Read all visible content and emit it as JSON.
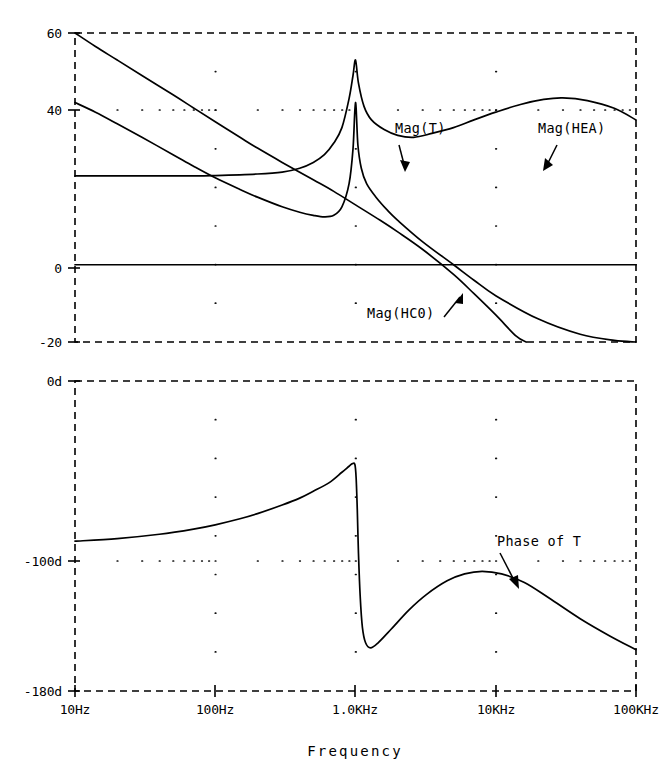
{
  "chart_data": {
    "type": "line",
    "title": "",
    "xlabel": "Frequency",
    "xscale": "log",
    "xlim": [
      10,
      100000
    ],
    "xticks": [
      10,
      100,
      1000,
      10000,
      100000
    ],
    "xtick_labels": [
      "10Hz",
      "100Hz",
      "1.0KHz",
      "10KHz",
      "100KHz"
    ],
    "grid": true,
    "legend": "annotations",
    "panels": [
      {
        "name": "magnitude",
        "ylabel": "",
        "ylim": [
          -20,
          60
        ],
        "yticks": [
          -20,
          0,
          40,
          60
        ],
        "ytick_labels": [
          "-20",
          "0",
          "40",
          "60"
        ],
        "units": "dB",
        "series": [
          {
            "name": "Mag(HC0)",
            "label": "Mag(HC0)",
            "annotation": "Mag(HC0)",
            "description": "Falls monotonically from 60 dB at 10 Hz, crossing 0 dB near 3 kHz and reaching -20 dB near 20 kHz",
            "points": [
              [
                10,
                60.0
              ],
              [
                14,
                56.5
              ],
              [
                20,
                53.0
              ],
              [
                30,
                49.0
              ],
              [
                50,
                44.0
              ],
              [
                70,
                40.6
              ],
              [
                100,
                37.0
              ],
              [
                150,
                33.0
              ],
              [
                200,
                30.2
              ],
              [
                300,
                26.5
              ],
              [
                500,
                22.0
              ],
              [
                700,
                19.0
              ],
              [
                1000,
                15.5
              ],
              [
                1500,
                11.5
              ],
              [
                2000,
                8.5
              ],
              [
                3000,
                4.0
              ],
              [
                5000,
                -2.5
              ],
              [
                7000,
                -7.5
              ],
              [
                10000,
                -13.0
              ],
              [
                14000,
                -18.5
              ],
              [
                16500,
                -20.0
              ]
            ]
          },
          {
            "name": "Mag(T)",
            "label": "Mag(T)",
            "annotation": "Mag(T)",
            "description": "Starts at 42 dB at 10 Hz, decays to a minimum of ~12 dB near 600 Hz, resonant peak of 42 dB at 1 kHz, then falls steeply past 0 dB to -20 dB at 100 kHz",
            "points": [
              [
                10,
                42.0
              ],
              [
                14,
                39.5
              ],
              [
                20,
                36.5
              ],
              [
                30,
                33.0
              ],
              [
                50,
                28.5
              ],
              [
                70,
                25.5
              ],
              [
                100,
                22.5
              ],
              [
                150,
                19.5
              ],
              [
                200,
                17.5
              ],
              [
                300,
                15.0
              ],
              [
                400,
                13.6
              ],
              [
                500,
                12.8
              ],
              [
                600,
                12.4
              ],
              [
                700,
                12.8
              ],
              [
                800,
                15.0
              ],
              [
                900,
                21.0
              ],
              [
                960,
                30.0
              ],
              [
                1000,
                42.0
              ],
              [
                1040,
                31.0
              ],
              [
                1100,
                25.0
              ],
              [
                1200,
                21.0
              ],
              [
                1400,
                17.5
              ],
              [
                1700,
                14.0
              ],
              [
                2000,
                11.5
              ],
              [
                3000,
                6.0
              ],
              [
                5000,
                0.0
              ],
              [
                7000,
                -4.0
              ],
              [
                10000,
                -8.0
              ],
              [
                20000,
                -14.0
              ],
              [
                40000,
                -18.0
              ],
              [
                70000,
                -19.6
              ],
              [
                100000,
                -20.0
              ]
            ]
          },
          {
            "name": "Mag(HEA)",
            "label": "Mag(HEA)",
            "annotation": "Mag(HEA)",
            "description": "Flat at 23 dB from 10 Hz, rises to a resonance peak of 53 dB at 1 kHz, falls to a local minimum of ~33 dB near 2.5 kHz, broad hump peaking at 25 dB near 30 kHz, ending near 18 dB at 100 kHz",
            "points": [
              [
                10,
                23.0
              ],
              [
                30,
                23.0
              ],
              [
                70,
                23.0
              ],
              [
                100,
                23.1
              ],
              [
                200,
                23.5
              ],
              [
                300,
                24.0
              ],
              [
                400,
                25.0
              ],
              [
                500,
                26.5
              ],
              [
                600,
                28.5
              ],
              [
                700,
                31.5
              ],
              [
                800,
                35.5
              ],
              [
                900,
                43.0
              ],
              [
                960,
                49.0
              ],
              [
                1000,
                53.0
              ],
              [
                1050,
                47.0
              ],
              [
                1150,
                41.0
              ],
              [
                1300,
                37.5
              ],
              [
                1600,
                35.0
              ],
              [
                2000,
                33.5
              ],
              [
                2600,
                33.0
              ],
              [
                3500,
                34.0
              ],
              [
                5000,
                35.5
              ],
              [
                7000,
                37.5
              ],
              [
                10000,
                39.5
              ],
              [
                15000,
                41.5
              ],
              [
                22000,
                42.8
              ],
              [
                30000,
                43.2
              ],
              [
                45000,
                42.5
              ],
              [
                70000,
                40.5
              ],
              [
                100000,
                37.5
              ]
            ]
          },
          {
            "name": "zero-line",
            "label": "",
            "annotation": "",
            "description": "Solid reference line at 0 dB spanning the full frequency range",
            "points": [
              [
                10,
                0
              ],
              [
                100000,
                0
              ]
            ]
          }
        ]
      },
      {
        "name": "phase",
        "ylabel": "",
        "ylim": [
          -180,
          0
        ],
        "yticks": [
          0,
          -100,
          -180
        ],
        "ytick_labels": [
          "0d",
          "-100d",
          "-180d"
        ],
        "units": "degrees",
        "series": [
          {
            "name": "Phase of T",
            "label": "Phase of T",
            "annotation": "Phase of T",
            "description": "Starts at -93 deg at 10 Hz, rises slowly to a peak of -48 deg just under 1 kHz, drops abruptly through -100 deg at 1 kHz to a minimum of -155 deg near 1.3 kHz, recovers to -110 deg near 8 kHz, then declines to -155 deg at 100 kHz",
            "points": [
              [
                10,
                -93.0
              ],
              [
                20,
                -91.5
              ],
              [
                40,
                -89.0
              ],
              [
                70,
                -86.0
              ],
              [
                100,
                -83.5
              ],
              [
                150,
                -80.0
              ],
              [
                200,
                -77.0
              ],
              [
                300,
                -72.0
              ],
              [
                400,
                -68.0
              ],
              [
                500,
                -64.0
              ],
              [
                650,
                -59.0
              ],
              [
                800,
                -53.0
              ],
              [
                900,
                -49.5
              ],
              [
                950,
                -48.0
              ],
              [
                990,
                -48.5
              ],
              [
                1010,
                -56.0
              ],
              [
                1030,
                -75.0
              ],
              [
                1050,
                -100.0
              ],
              [
                1080,
                -125.0
              ],
              [
                1120,
                -143.0
              ],
              [
                1180,
                -152.0
              ],
              [
                1280,
                -155.0
              ],
              [
                1450,
                -152.0
              ],
              [
                1800,
                -144.0
              ],
              [
                2400,
                -133.0
              ],
              [
                3200,
                -124.0
              ],
              [
                4500,
                -116.0
              ],
              [
                6000,
                -112.0
              ],
              [
                8000,
                -110.5
              ],
              [
                11000,
                -112.0
              ],
              [
                16000,
                -117.0
              ],
              [
                24000,
                -126.0
              ],
              [
                40000,
                -138.0
              ],
              [
                65000,
                -148.0
              ],
              [
                100000,
                -156.0
              ]
            ]
          }
        ]
      }
    ],
    "annotations": [
      {
        "text": "Mag(T)",
        "target_series": "Mag(T)"
      },
      {
        "text": "Mag(HEA)",
        "target_series": "Mag(HEA)"
      },
      {
        "text": "Mag(HC0)",
        "target_series": "Mag(HC0)"
      },
      {
        "text": "Phase of T",
        "target_series": "Phase of T"
      }
    ]
  },
  "colors": {
    "background": "#ffffff",
    "ink": "#000000"
  }
}
